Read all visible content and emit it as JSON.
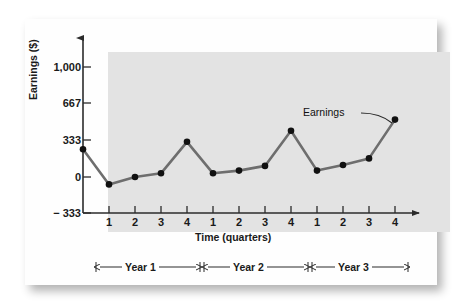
{
  "chart_data": {
    "type": "line",
    "title": "",
    "xlabel": "Time (quarters)",
    "ylabel": "Earnings ($)",
    "ylim": [
      -333,
      1167
    ],
    "yticks": [
      -333,
      0,
      333,
      667,
      1000
    ],
    "ytick_labels": [
      "− 333",
      "0",
      "333",
      "667",
      "1,000"
    ],
    "xlim": [
      0,
      12.6
    ],
    "categories": [
      "1",
      "2",
      "3",
      "4",
      "1",
      "2",
      "3",
      "4",
      "1",
      "2",
      "3",
      "4"
    ],
    "xtick_labels": [
      "1",
      "2",
      "3",
      "4",
      "1",
      "2",
      "3",
      "4",
      "1",
      "2",
      "3",
      "4"
    ],
    "grid": false,
    "legend": "none",
    "series": [
      {
        "name": "Earnings",
        "color": "#6e6e6e",
        "marker_color": "#111111",
        "x": [
          0,
          1,
          2,
          3,
          4,
          5,
          6,
          7,
          8,
          9,
          10,
          11,
          12
        ],
        "values": [
          250,
          -67,
          0,
          33,
          317,
          33,
          58,
          100,
          417,
          58,
          108,
          167,
          517
        ]
      }
    ],
    "annotations": [
      {
        "text": "Earnings",
        "points_to_x": 12,
        "points_to_y": 517
      }
    ],
    "group_brackets": [
      {
        "label": "Year 1",
        "from_x": 1,
        "to_x": 4
      },
      {
        "label": "Year 2",
        "from_x": 5,
        "to_x": 8
      },
      {
        "label": "Year 3",
        "from_x": 9,
        "to_x": 12
      }
    ]
  },
  "axes": {
    "y_title": "Earnings ($)",
    "x_title": "Time (quarters)",
    "y_tick_1000": "1,000",
    "y_tick_667": "667",
    "y_tick_333": "333",
    "y_tick_0": "0",
    "y_tick_neg333": "− 333"
  },
  "x_ticks": {
    "t1": "1",
    "t2": "2",
    "t3": "3",
    "t4": "4",
    "t5": "1",
    "t6": "2",
    "t7": "3",
    "t8": "4",
    "t9": "1",
    "t10": "2",
    "t11": "3",
    "t12": "4"
  },
  "annotation": {
    "series_label": "Earnings"
  },
  "year_brackets": {
    "year1": "Year 1",
    "year2": "Year 2",
    "year3": "Year 3"
  },
  "colors": {
    "line": "#6e6e6e",
    "marker": "#111111",
    "plot_background": "#e3e3e3",
    "card_background": "#fefefe",
    "axis": "#3a3a3a",
    "text": "#1a1a1a"
  }
}
